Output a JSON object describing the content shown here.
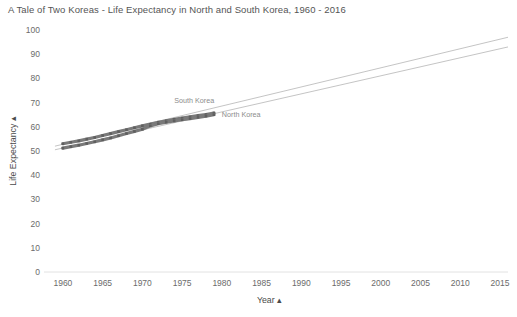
{
  "chart_data": {
    "type": "line",
    "title": "A Tale of Two Koreas - Life Expectancy in North and South Korea, 1960 - 2016",
    "xlabel": "Year",
    "ylabel": "Life Expectancy",
    "xlabel_sort_indicator": "▴",
    "ylabel_sort_indicator": "▴",
    "xlim": [
      1958,
      2016
    ],
    "ylim": [
      0,
      100
    ],
    "xticks": [
      1960,
      1965,
      1970,
      1975,
      1980,
      1985,
      1990,
      1995,
      2000,
      2005,
      2010,
      2015
    ],
    "yticks": [
      0,
      10,
      20,
      30,
      40,
      50,
      60,
      70,
      80,
      90,
      100
    ],
    "grid": false,
    "legend": "inline-labels",
    "line_color": "#7a7a7a",
    "trend_color": "#b5b5b5",
    "x": [
      1960,
      1961,
      1962,
      1963,
      1964,
      1965,
      1966,
      1967,
      1968,
      1969,
      1970,
      1971,
      1972,
      1973,
      1974,
      1975,
      1976,
      1977,
      1978,
      1979
    ],
    "series": [
      {
        "name": "South Korea",
        "label_x": 1974,
        "label_y": 70,
        "values": [
          53.0,
          53.6,
          54.2,
          54.9,
          55.6,
          56.4,
          57.2,
          58.0,
          58.8,
          59.6,
          60.4,
          61.1,
          61.9,
          62.5,
          63.1,
          63.6,
          64.1,
          64.6,
          65.1,
          65.7
        ]
      },
      {
        "name": "North Korea",
        "label_x": 1980,
        "label_y": 64,
        "values": [
          51.2,
          51.8,
          52.4,
          53.1,
          53.8,
          54.6,
          55.4,
          56.3,
          57.2,
          58.1,
          59.0,
          60.4,
          61.3,
          61.9,
          62.4,
          62.9,
          63.4,
          63.9,
          64.4,
          65.0
        ]
      }
    ],
    "trendlines": [
      {
        "name": "South Korea trend",
        "x": [
          1959,
          2016
        ],
        "y": [
          52.0,
          97.0
        ]
      },
      {
        "name": "North Korea trend",
        "x": [
          1959,
          2016
        ],
        "y": [
          50.5,
          93.0
        ]
      }
    ]
  }
}
